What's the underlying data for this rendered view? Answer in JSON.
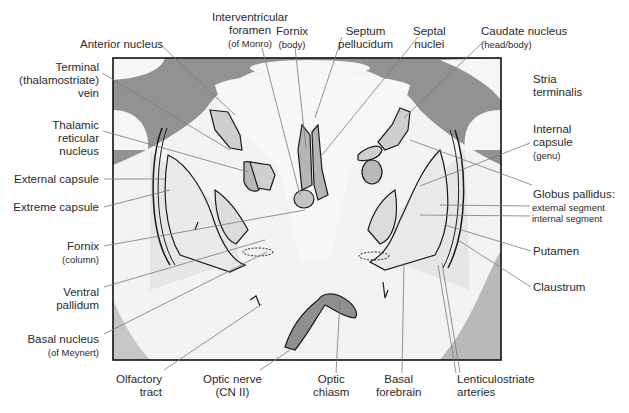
{
  "diagram": {
    "type": "coronal brain section (anatomical illustration)",
    "colors": {
      "gray_matter": "#8f8f8f",
      "white_matter": "#f4f4f4",
      "outline": "#1a1a1a",
      "leader_line": "#777777",
      "frame": "#111111"
    },
    "labels": {
      "top": [
        {
          "id": "anterior-nucleus",
          "text": "Anterior nucleus"
        },
        {
          "id": "interventricular-foramen",
          "text": "Interventricular\nforamen",
          "sub": "(of Monro)"
        },
        {
          "id": "fornix-body",
          "text": "Fornix",
          "sub": "(body)"
        },
        {
          "id": "septum-pellucidum",
          "text": "Septum\npellucidum"
        },
        {
          "id": "septal-nuclei",
          "text": "Septal\nnuclei"
        },
        {
          "id": "caudate-nucleus",
          "text": "Caudate nucleus",
          "sub": "(head/body)"
        }
      ],
      "left": [
        {
          "id": "terminal-vein",
          "text": "Terminal\n(thalamostriate)\nvein"
        },
        {
          "id": "thalamic-reticular-nucleus",
          "text": "Thalamic\nreticular\nnucleus"
        },
        {
          "id": "external-capsule",
          "text": "External capsule"
        },
        {
          "id": "extreme-capsule",
          "text": "Extreme capsule"
        },
        {
          "id": "fornix-column",
          "text": "Fornix",
          "sub": "(column)"
        },
        {
          "id": "ventral-pallidum",
          "text": "Ventral\npallidum"
        },
        {
          "id": "basal-nucleus",
          "text": "Basal nucleus",
          "sub": "(of Meynert)"
        }
      ],
      "right": [
        {
          "id": "stria-terminalis",
          "text": "Stria\nterminalis"
        },
        {
          "id": "internal-capsule",
          "text": "Internal\ncapsule",
          "sub": "(genu)"
        },
        {
          "id": "globus-pallidus",
          "text": "Globus pallidus:"
        },
        {
          "id": "gp-external",
          "text": "external segment"
        },
        {
          "id": "gp-internal",
          "text": "internal segment"
        },
        {
          "id": "putamen",
          "text": "Putamen"
        },
        {
          "id": "claustrum",
          "text": "Claustrum"
        }
      ],
      "bottom": [
        {
          "id": "olfactory-tract",
          "text": "Olfactory\ntract"
        },
        {
          "id": "optic-nerve",
          "text": "Optic nerve",
          "sub": "(CN II)"
        },
        {
          "id": "optic-chiasm",
          "text": "Optic\nchiasm"
        },
        {
          "id": "basal-forebrain",
          "text": "Basal\nforebrain"
        },
        {
          "id": "lenticulostriate-arteries",
          "text": "Lenticulostriate\narteries"
        }
      ]
    }
  }
}
